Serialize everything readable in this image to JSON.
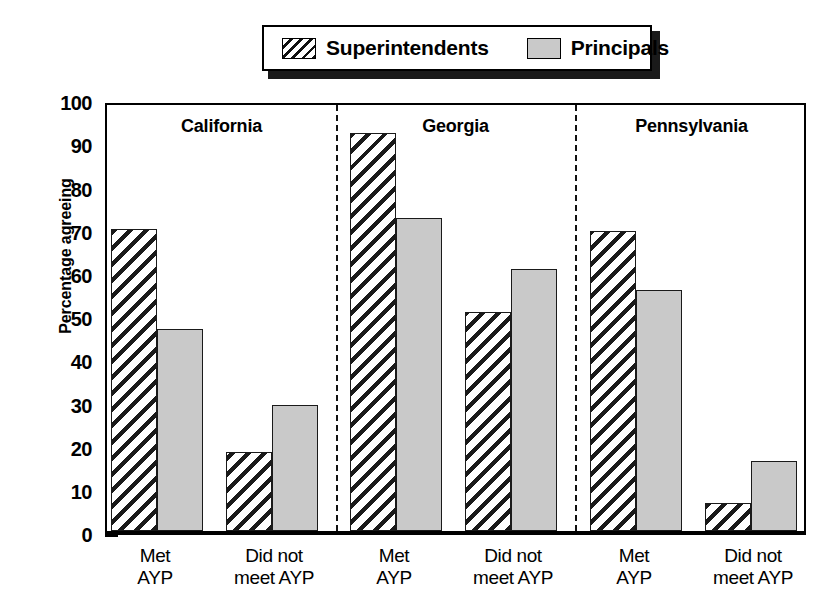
{
  "legend": {
    "entries": [
      {
        "label": "Superintendents",
        "swatch": "hatched-diagonal",
        "pattern": "hatch"
      },
      {
        "label": "Principals",
        "swatch": "solid-gray",
        "pattern": "solid"
      }
    ]
  },
  "axes": {
    "ylabel": "Percentage agreeing",
    "yticks": [
      "0",
      "10",
      "20",
      "30",
      "40",
      "50",
      "60",
      "70",
      "80",
      "90",
      "100"
    ]
  },
  "panels": [
    {
      "title": "California"
    },
    {
      "title": "Georgia"
    },
    {
      "title": "Pennsylvania"
    }
  ],
  "xlabels": [
    {
      "line1": "Met",
      "line2": "AYP"
    },
    {
      "line1": "Did not",
      "line2": "meet AYP"
    },
    {
      "line1": "Met",
      "line2": "AYP"
    },
    {
      "line1": "Did not",
      "line2": "meet AYP"
    },
    {
      "line1": "Met",
      "line2": "AYP"
    },
    {
      "line1": "Did not",
      "line2": "meet AYP"
    }
  ],
  "colors": {
    "bar_fill_principals": "#c9c9c9",
    "bar_outline": "#1a1a1a",
    "background": "#ffffff",
    "axis": "#000000"
  },
  "chart_data": {
    "type": "bar",
    "title": "",
    "xlabel": "",
    "ylabel": "Percentage agreeing",
    "ylim": [
      0,
      100
    ],
    "ytick_step": 10,
    "grid": false,
    "legend_position": "top-center",
    "grouping": "grouped bars, 3 state panels separated by dashed lines",
    "categories": [
      "California / Met AYP",
      "California / Did not meet AYP",
      "Georgia / Met AYP",
      "Georgia / Did not meet AYP",
      "Pennsylvania / Met AYP",
      "Pennsylvania / Did not meet AYP"
    ],
    "series": [
      {
        "name": "Superintendents",
        "pattern": "hatch",
        "values": [
          71,
          18.5,
          93.5,
          51.5,
          70.5,
          6.5
        ]
      },
      {
        "name": "Principals",
        "pattern": "solid",
        "values": [
          47.5,
          29.5,
          73.5,
          61.5,
          56.5,
          16.5
        ]
      }
    ],
    "panels": [
      {
        "name": "California",
        "groups": [
          {
            "label": "Met AYP",
            "Superintendents": 71,
            "Principals": 47.5
          },
          {
            "label": "Did not meet AYP",
            "Superintendents": 18.5,
            "Principals": 29.5
          }
        ]
      },
      {
        "name": "Georgia",
        "groups": [
          {
            "label": "Met AYP",
            "Superintendents": 93.5,
            "Principals": 73.5
          },
          {
            "label": "Did not meet AYP",
            "Superintendents": 51.5,
            "Principals": 61.5
          }
        ]
      },
      {
        "name": "Pennsylvania",
        "groups": [
          {
            "label": "Met AYP",
            "Superintendents": 70.5,
            "Principals": 56.5
          },
          {
            "label": "Did not meet AYP",
            "Superintendents": 6.5,
            "Principals": 16.5
          }
        ]
      }
    ]
  }
}
